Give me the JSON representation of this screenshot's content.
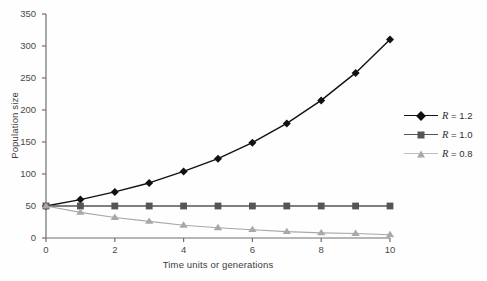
{
  "chart_data": {
    "type": "line",
    "title": "",
    "xlabel": "Time units or generations",
    "ylabel": "Population size",
    "xlim": [
      0,
      10
    ],
    "ylim": [
      0,
      350
    ],
    "xticks": [
      0,
      2,
      4,
      6,
      8,
      10
    ],
    "xtick_labels": [
      "0",
      "2",
      "4",
      "6",
      "8",
      "10"
    ],
    "yticks": [
      0,
      50,
      100,
      150,
      200,
      250,
      300,
      350
    ],
    "ytick_labels": [
      "0",
      "50",
      "100",
      "150",
      "200",
      "250",
      "300",
      "350"
    ],
    "grid": false,
    "legend_position": "right",
    "x": [
      0,
      1,
      2,
      3,
      4,
      5,
      6,
      7,
      8,
      9,
      10
    ],
    "series": [
      {
        "name": "R = 1.2",
        "marker": "diamond",
        "color": "#111111",
        "values": [
          50,
          60,
          72,
          86,
          104,
          124,
          149,
          179,
          215,
          258,
          310
        ]
      },
      {
        "name": "R = 1.0",
        "marker": "square",
        "color": "#555555",
        "values": [
          50,
          50,
          50,
          50,
          50,
          50,
          50,
          50,
          50,
          50,
          50
        ]
      },
      {
        "name": "R = 0.8",
        "marker": "triangle",
        "color": "#a8a8a8",
        "values": [
          50,
          40,
          32,
          26,
          20,
          16,
          13,
          10,
          8,
          7,
          5
        ]
      }
    ]
  },
  "legend": {
    "items": [
      {
        "label": "R = 1.2",
        "symbol": "R",
        "equals_value": " = 1.2"
      },
      {
        "label": "R = 1.0",
        "symbol": "R",
        "equals_value": " = 1.0"
      },
      {
        "label": "R = 0.8",
        "symbol": "R",
        "equals_value": " = 0.8"
      }
    ]
  },
  "axes": {
    "y_title": "Population size",
    "x_title": "Time units or generations"
  },
  "colors": {
    "series_1": "#111111",
    "series_2": "#555555",
    "series_3": "#a8a8a8",
    "axis": "#6f6f6f",
    "text": "#3b3b3b",
    "background": "#fefefe"
  }
}
